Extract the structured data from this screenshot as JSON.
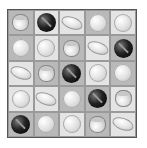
{
  "board": {
    "rows": 5,
    "cols": 5,
    "cells": [
      [
        {
          "type": "cup",
          "bg": "mid"
        },
        {
          "type": "dark",
          "bg": "light"
        },
        {
          "type": "ellipse",
          "bg": "light"
        },
        {
          "type": "sphere",
          "bg": "mid"
        },
        {
          "type": "sphere",
          "bg": "light"
        }
      ],
      [
        {
          "type": "sphere",
          "bg": "mid"
        },
        {
          "type": "sphere",
          "bg": "light"
        },
        {
          "type": "cup",
          "bg": "mid"
        },
        {
          "type": "ellipse",
          "bg": "light"
        },
        {
          "type": "dark",
          "bg": "mid"
        }
      ],
      [
        {
          "type": "ellipse",
          "bg": "light"
        },
        {
          "type": "cup",
          "bg": "mid"
        },
        {
          "type": "dark",
          "bg": "mid"
        },
        {
          "type": "sphere",
          "bg": "light"
        },
        {
          "type": "sphere",
          "bg": "mid"
        }
      ],
      [
        {
          "type": "sphere",
          "bg": "light"
        },
        {
          "type": "ellipse",
          "bg": "light"
        },
        {
          "type": "sphere",
          "bg": "mid"
        },
        {
          "type": "dark",
          "bg": "mid"
        },
        {
          "type": "cup",
          "bg": "light"
        }
      ],
      [
        {
          "type": "dark",
          "bg": "mid"
        },
        {
          "type": "sphere",
          "bg": "mid"
        },
        {
          "type": "sphere",
          "bg": "light"
        },
        {
          "type": "cup",
          "bg": "mid"
        },
        {
          "type": "ellipse",
          "bg": "light"
        }
      ]
    ]
  }
}
